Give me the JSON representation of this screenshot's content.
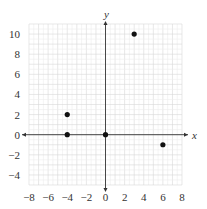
{
  "chart_data": {
    "type": "scatter",
    "title": "",
    "xlabel": "x",
    "ylabel": "y",
    "xlim": [
      -8,
      8
    ],
    "ylim": [
      -5,
      11
    ],
    "grid": true,
    "x_ticks": [
      -8,
      -6,
      -4,
      -2,
      0,
      2,
      4,
      6,
      8
    ],
    "y_ticks": [
      -4,
      -2,
      0,
      2,
      4,
      6,
      8,
      10
    ],
    "points": [
      {
        "x": -4,
        "y": 2
      },
      {
        "x": -4,
        "y": 0
      },
      {
        "x": 0,
        "y": 0
      },
      {
        "x": 3,
        "y": 10
      },
      {
        "x": 6,
        "y": -1
      }
    ],
    "colors": {
      "point": "#111111",
      "axis": "#333333",
      "grid_major": "#d8d8d8",
      "grid_minor": "#ececec"
    }
  }
}
